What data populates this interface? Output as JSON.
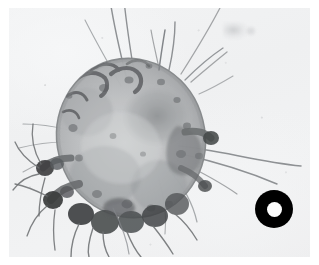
{
  "figure": {
    "domain": "Natural-Image",
    "kind": "photomicrograph",
    "caption": "",
    "subject_common_name": "scabies mite",
    "subject_scientific_name": "Sarcoptes scabiei",
    "view": "dorsal, brightfield light microscopy",
    "colors": {
      "background": "#f1f2f3",
      "plate_border": "#ffffff",
      "body_fill": "#b9bbbc",
      "body_mottle_dark": "#6e7173",
      "body_outline": "#7d8082",
      "leg_dark": "#3c3e40",
      "seta": "#8c8f91",
      "marker_ring": "#000000",
      "marker_core": "#fdfdfd"
    }
  },
  "plate": {
    "label": "microscope-field",
    "width_px": 301,
    "height_px": 249,
    "offset_x_px": 9,
    "offset_y_px": 8
  },
  "specimen": {
    "label": "mite-body",
    "center_x_px": 131,
    "center_y_px": 138,
    "radius_x_px": 74,
    "radius_y_px": 80,
    "legs_count": 8,
    "visible_leg_clusters": [
      "anterior-left",
      "posterior-left",
      "posterior-ventral"
    ],
    "long_setae_count": 12,
    "notes": "rounded tortoise-shaped idiosoma with mottled cuticle, dark striae on the dorsal shield, stubby legs terminating in dark tarsi and long whip-like setae"
  },
  "marker": {
    "label": "scale-ring-marker",
    "shape": "annulus",
    "outer_diameter_px": 38,
    "inner_diameter_px": 15,
    "center_x_px": 274,
    "center_y_px": 209,
    "outer_color": "#000000",
    "inner_color": "#fdfdfd"
  },
  "artifacts": [
    {
      "label": "out-of-focus-debris",
      "x_px": 214,
      "y_px": 14
    },
    {
      "label": "out-of-focus-debris",
      "x_px": 236,
      "y_px": 18
    }
  ]
}
